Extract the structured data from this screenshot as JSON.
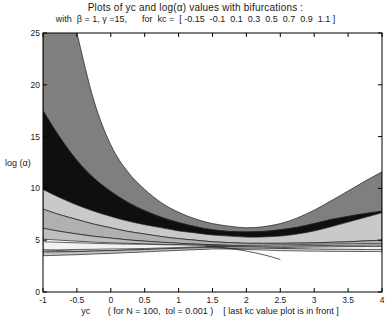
{
  "page": {
    "title_line1": "Plots of yc and log(α) values with bifurcations :",
    "title_line2": "with  β = 1, γ =15,      for  kc =  [ -0.15  -0.1  0.1  0.3  0.5  0.7  0.9  1.1 ]",
    "ylabel": "log (α)",
    "xlabel": "yc       ( for N = 100,  tol = 0.001 )    [ last kc value plot is in front ]"
  },
  "chart_data": {
    "type": "area",
    "title": "Plots of yc and log(α) values with bifurcations : with β = 1, γ =15, for kc = [ -0.15 -0.1 0.1 0.3 0.5 0.7 0.9 1.1 ]",
    "xlabel": "yc",
    "ylabel": "log (α)",
    "annotations": [
      "( for N = 100,  tol = 0.001 )",
      "[ last kc value plot is in front ]"
    ],
    "params": {
      "beta": 1,
      "gamma": 15,
      "N": 100,
      "tol": 0.001,
      "kc_values": [
        -0.15,
        -0.1,
        0.1,
        0.3,
        0.5,
        0.7,
        0.9,
        1.1
      ],
      "draw_order_note": "last kc value plot is in front"
    },
    "xlim": [
      -1,
      4
    ],
    "ylim": [
      0,
      25
    ],
    "grid": false,
    "legend": "none",
    "x_ticks": [
      {
        "v": -1,
        "label": "-1"
      },
      {
        "v": -0.5,
        "label": "-0.5"
      },
      {
        "v": 0,
        "label": "0"
      },
      {
        "v": 0.5,
        "label": "0.5"
      },
      {
        "v": 1,
        "label": "1"
      },
      {
        "v": 1.5,
        "label": "1.5"
      },
      {
        "v": 2,
        "label": "2"
      },
      {
        "v": 2.5,
        "label": "2.5"
      },
      {
        "v": 3,
        "label": "3"
      },
      {
        "v": 3.5,
        "label": "3.5"
      },
      {
        "v": 4,
        "label": "4"
      }
    ],
    "y_ticks": [
      {
        "v": 0,
        "label": "0"
      },
      {
        "v": 5,
        "label": "5"
      },
      {
        "v": 10,
        "label": "10"
      },
      {
        "v": 15,
        "label": "15"
      },
      {
        "v": 20,
        "label": "20"
      },
      {
        "v": 25,
        "label": "25"
      }
    ],
    "frame_color": "#000000",
    "edge_color": "#1c1c1c",
    "x_samples": [
      -1,
      -0.75,
      -0.5,
      -0.25,
      0,
      0.25,
      0.5,
      0.75,
      1,
      1.25,
      1.5,
      1.75,
      2,
      2.25,
      2.5,
      2.75,
      3,
      3.25,
      3.5,
      3.75,
      4
    ],
    "bands": [
      {
        "kc": -0.15,
        "color": "#7f7f7f",
        "upper": [
          45,
          32,
          25,
          18.5,
          14.2,
          11.6,
          9.9,
          8.6,
          7.7,
          7.05,
          6.6,
          6.35,
          6.2,
          6.3,
          6.6,
          7.15,
          7.9,
          8.8,
          9.75,
          10.7,
          11.6
        ],
        "lower": [
          17.5,
          14.9,
          12.7,
          11,
          9.7,
          8.65,
          7.85,
          7.2,
          6.7,
          6.3,
          6,
          5.85,
          5.8,
          5.85,
          6,
          6.25,
          6.6,
          7,
          7.3,
          7.57,
          7.8
        ]
      },
      {
        "kc": -0.1,
        "color": "#0f0f0f",
        "upper": [
          17.5,
          14.9,
          12.7,
          11,
          9.7,
          8.65,
          7.85,
          7.2,
          6.7,
          6.3,
          6,
          5.85,
          5.8,
          5.85,
          6,
          6.25,
          6.6,
          7,
          7.3,
          7.57,
          7.8
        ],
        "lower": [
          9.9,
          9.1,
          8.4,
          7.8,
          7.3,
          6.85,
          6.5,
          6.2,
          5.9,
          5.7,
          5.5,
          5.4,
          5.3,
          5.32,
          5.4,
          5.6,
          5.9,
          6.3,
          6.75,
          7.2,
          7.65
        ]
      },
      {
        "kc": 0.1,
        "color": "#c9c9c9",
        "upper": [
          9.9,
          9.1,
          8.4,
          7.8,
          7.3,
          6.85,
          6.5,
          6.2,
          5.9,
          5.7,
          5.5,
          5.4,
          5.3,
          5.32,
          5.4,
          5.6,
          5.9,
          6.3,
          6.75,
          7.2,
          7.65
        ],
        "lower": [
          8,
          7.45,
          7,
          6.55,
          6.2,
          5.85,
          5.6,
          5.35,
          5.15,
          5,
          4.85,
          4.77,
          4.7,
          4.7,
          4.7,
          4.72,
          4.75,
          4.8,
          4.85,
          4.93,
          5
        ]
      },
      {
        "kc": 0.3,
        "color": "#b0b0b0",
        "upper": [
          8,
          7.45,
          7,
          6.55,
          6.2,
          5.85,
          5.6,
          5.35,
          5.15,
          5,
          4.85,
          4.77,
          4.7,
          4.7,
          4.7,
          4.72,
          4.75,
          4.8,
          4.85,
          4.93,
          5
        ],
        "lower": [
          6.15,
          5.85,
          5.6,
          5.38,
          5.2,
          5.03,
          4.9,
          4.8,
          4.7,
          4.62,
          4.55,
          4.5,
          4.45,
          4.42,
          4.4,
          4.38,
          4.35,
          4.33,
          4.31,
          4.3,
          4.3
        ]
      },
      {
        "kc": 0.5,
        "color": "#bfbfbf",
        "upper": [
          6.15,
          5.85,
          5.6,
          5.38,
          5.2,
          5.03,
          4.9,
          4.8,
          4.7,
          4.62,
          4.55,
          4.5,
          4.45,
          4.42,
          4.4,
          4.38,
          4.35,
          4.33,
          4.31,
          4.3,
          4.3
        ],
        "lower": [
          5.1,
          5,
          4.9,
          4.82,
          4.75,
          4.7,
          4.65,
          4.6,
          4.55,
          4.52,
          4.5,
          4.45,
          4.4,
          4.35,
          4.3,
          4.27,
          4.25,
          4.22,
          4.2,
          4.17,
          4.15
        ]
      },
      {
        "kc": 0.7,
        "color": "#f2f2f2",
        "upper": [
          4.85,
          4.8,
          4.75,
          4.7,
          4.65,
          4.62,
          4.6,
          4.57,
          4.55,
          4.52,
          4.5,
          4.5,
          4.5,
          4.52,
          4.55,
          4.57,
          4.6,
          4.62,
          4.65,
          4.67,
          4.7
        ],
        "lower": [
          4.05,
          4.07,
          4.1,
          4.12,
          4.15,
          4.17,
          4.2,
          4.25,
          4.3,
          4.35,
          4.4,
          4.37,
          4.35,
          4.27,
          4.2,
          4.15,
          4.1,
          4.07,
          4.05,
          4.02,
          4
        ]
      },
      {
        "kc": 0.9,
        "color": "#e3e3e3",
        "upper": [
          4.05,
          4,
          3.95,
          3.97,
          4,
          4.05,
          4.1,
          4.15,
          4.2,
          4.28,
          4.35,
          4.33,
          4.3,
          4.25,
          4.2,
          4.17,
          4.15,
          4.13,
          4.12,
          4.1,
          4.1
        ],
        "lower": [
          3.86,
          3.88,
          3.9,
          3.92,
          3.95,
          4,
          4.05,
          4.1,
          4.15,
          4.18,
          4.2,
          4.15,
          4.1,
          4.05,
          4,
          3.97,
          3.95,
          3.93,
          3.92,
          3.91,
          3.9
        ]
      },
      {
        "kc": 1.1,
        "color": "#c4c4c4",
        "upper": [
          3.86,
          3.88,
          3.9,
          3.95,
          4,
          4.05,
          4.1,
          4.17,
          4.22,
          4.27,
          4.3,
          4.34,
          4.37,
          4.4,
          4.43,
          4.46,
          4.48,
          4.5,
          4.52,
          4.54,
          4.55
        ],
        "lower": [
          3.5,
          3.55,
          3.6,
          3.67,
          3.73,
          3.8,
          3.87,
          3.95,
          4.02,
          4.08,
          4.15,
          4.19,
          4.23,
          4.26,
          4.29,
          4.32,
          4.34,
          4.36,
          4.38,
          4.39,
          4.4
        ]
      }
    ],
    "extra_line": {
      "points": [
        [
          1.4,
          4.45
        ],
        [
          1.7,
          4.25
        ],
        [
          2.0,
          3.95
        ],
        [
          2.25,
          3.6
        ],
        [
          2.5,
          3.15
        ]
      ],
      "color": "#2a2a2a"
    }
  }
}
